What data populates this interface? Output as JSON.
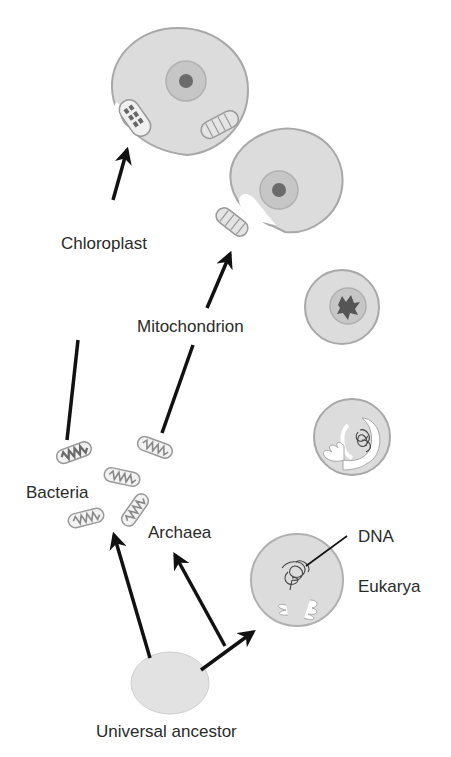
{
  "diagram": {
    "type": "endosymbiosis-tree-of-life",
    "colors": {
      "cell_fill": "#dcdcdc",
      "cell_stroke": "#a8a8a8",
      "nucleus_fill": "#c6c6c6",
      "nucleolus_fill": "#6b6b6b",
      "arrow": "#111111",
      "text": "#2a2a2a"
    },
    "labels": {
      "chloroplast": "Chloroplast",
      "mitochondrion": "Mitochondrion",
      "bacteria": "Bacteria",
      "archaea": "Archaea",
      "dna": "DNA",
      "eukarya": "Eukarya",
      "universal_ancestor": "Universal ancestor"
    },
    "nodes": [
      {
        "id": "universal-ancestor",
        "label": "Universal ancestor"
      },
      {
        "id": "bacteria",
        "label": "Bacteria"
      },
      {
        "id": "archaea",
        "label": "Archaea"
      },
      {
        "id": "eukarya-early",
        "label": "Eukarya"
      },
      {
        "id": "eukarya-infolding"
      },
      {
        "id": "eukarya-nucleus"
      },
      {
        "id": "eukarya-with-mitochondrion"
      },
      {
        "id": "eukarya-with-chloroplast"
      }
    ],
    "edges": [
      {
        "from": "universal-ancestor",
        "to": "bacteria"
      },
      {
        "from": "universal-ancestor",
        "to": "archaea"
      },
      {
        "from": "universal-ancestor",
        "to": "eukarya-early"
      },
      {
        "from": "bacteria",
        "to": "eukarya-with-mitochondrion",
        "label": "Mitochondrion"
      },
      {
        "from": "bacteria",
        "to": "eukarya-with-chloroplast",
        "label": "Chloroplast"
      }
    ]
  }
}
